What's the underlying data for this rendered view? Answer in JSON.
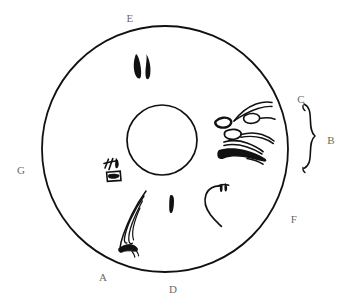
{
  "figure": {
    "background_color": "#ffffff",
    "ink_color": "#111111",
    "label_color": "#6e6a66",
    "outer_ring": {
      "name": "outer-circle",
      "center_x": 165,
      "center_y": 149,
      "radius": 123,
      "stroke_width": 1.7
    },
    "inner_circle": {
      "name": "inner-circle",
      "center_x": 162,
      "center_y": 140,
      "radius": 35,
      "stroke_width": 1.6
    },
    "brace": {
      "name": "region-brace",
      "label": "B",
      "top_y": 104,
      "bottom_y": 174,
      "x": 311
    },
    "labels": [
      {
        "id": "A",
        "text": "A",
        "x": 103,
        "y": 277,
        "position": "bottom-left outside ring"
      },
      {
        "id": "B",
        "text": "B",
        "x": 331,
        "y": 140,
        "position": "right of brace"
      },
      {
        "id": "C",
        "text": "C",
        "x": 301,
        "y": 99,
        "position": "upper-right outside ring"
      },
      {
        "id": "D",
        "text": "D",
        "x": 173,
        "y": 289,
        "position": "bottom outside ring"
      },
      {
        "id": "E",
        "text": "E",
        "x": 130,
        "y": 18,
        "position": "top outside ring"
      },
      {
        "id": "F",
        "text": "F",
        "x": 294,
        "y": 219,
        "position": "lower-right outside ring"
      },
      {
        "id": "G",
        "text": "G",
        "x": 21,
        "y": 170,
        "position": "left outside ring"
      }
    ],
    "lesions": [
      {
        "id": "lesion-top-pair",
        "name": "flame-hemorrhage-top",
        "description": "two dark elongated curved marks near top of ring",
        "approx_x": 142,
        "approx_y": 65
      },
      {
        "id": "lesion-right-cluster",
        "name": "hemorrhage-cluster-right",
        "description": "cluster of elongated ring-outlined lesions with tapering tails at the right of the ring",
        "approx_x": 245,
        "approx_y": 128
      },
      {
        "id": "lesion-right-solid",
        "name": "solid-hemorrhage-right",
        "description": "solid black tapering blot beneath the right cluster",
        "approx_x": 243,
        "approx_y": 153
      },
      {
        "id": "lesion-center-left",
        "name": "scribble-lesion-center-left",
        "description": "small squiggle with dark square blotch left of the inner circle",
        "approx_x": 113,
        "approx_y": 172
      },
      {
        "id": "lesion-bottom-dash",
        "name": "dash-hemorrhage-bottom",
        "description": "short solid vertical dash below the inner circle",
        "approx_x": 172,
        "approx_y": 204
      },
      {
        "id": "lesion-hook",
        "name": "vessel-hook-lower-right",
        "description": "curved hook line with small dark squiggle at its top, lower-right quadrant",
        "approx_x": 217,
        "approx_y": 198
      },
      {
        "id": "lesion-a-flame",
        "name": "flame-hemorrhage-lower-left",
        "description": "long wavy flame-shaped streak running from the ring edge inward at label A",
        "approx_x": 125,
        "approx_y": 225
      }
    ]
  }
}
